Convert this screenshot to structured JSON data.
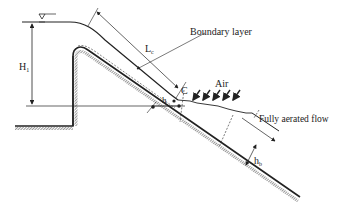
{
  "diagram": {
    "type": "spillway-flow-schematic",
    "labels": {
      "h1": "H",
      "h1_sub": "1",
      "lc": "L",
      "lc_sub": "c",
      "boundary_layer": "Boundary layer",
      "air": "Air",
      "c": "C",
      "h": "h",
      "fully_aerated": "Fully aerated flow",
      "hb": "h",
      "hb_sub": "b"
    },
    "colors": {
      "line": "#222222",
      "background": "#ffffff"
    }
  }
}
